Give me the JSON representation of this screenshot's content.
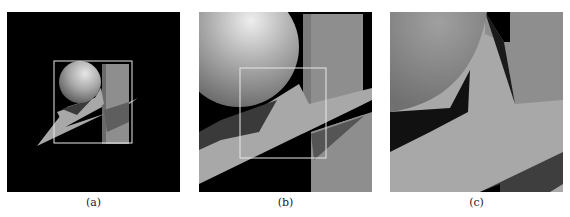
{
  "figure": {
    "panels": [
      {
        "id": "a",
        "label": "(a)",
        "description": "Full view of rendered scene: sphere, box and inclined plane on black background with zoom rectangle"
      },
      {
        "id": "b",
        "label": "(b)",
        "description": "Zoomed view of region marked in (a), with further zoom rectangle"
      },
      {
        "id": "c",
        "label": "(c)",
        "description": "Zoomed view of region marked in (b)"
      }
    ],
    "colors": {
      "background": "#000000",
      "plane": "#a8a8a8",
      "box": "#8e8e8e",
      "shadow": "#3a3a3a",
      "zoom_rect": "#e8e8e8"
    }
  }
}
